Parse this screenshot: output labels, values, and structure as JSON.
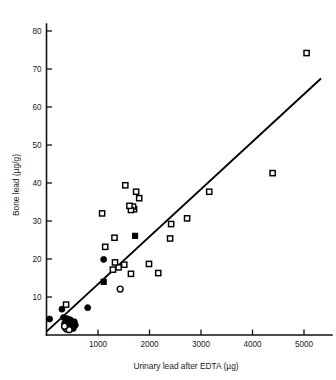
{
  "chart_data": {
    "type": "scatter",
    "title": "",
    "xlabel": "Urinary lead after EDTA (µg)",
    "ylabel": "Bone lead (µg/g)",
    "xlim": [
      0,
      5400
    ],
    "ylim": [
      0,
      84
    ],
    "xticks": [
      1000,
      2000,
      3000,
      4000,
      5000
    ],
    "xtick_labels": [
      "1000",
      "2000",
      "3000",
      "4000",
      "5000"
    ],
    "yticks": [
      10,
      20,
      30,
      40,
      50,
      60,
      70,
      80
    ],
    "ytick_labels": [
      "10",
      "20",
      "30",
      "40",
      "50",
      "60",
      "70",
      "80"
    ],
    "grid": false,
    "legend": "none",
    "marker_colors": {
      "stroke": "#000000",
      "open_fill": "#ffffff",
      "filled_fill": "#000000"
    },
    "series": [
      {
        "name": "open-square",
        "marker": "open-square",
        "points": [
          [
            5050,
            74.2
          ],
          [
            4390,
            42.6
          ],
          [
            3160,
            37.7
          ],
          [
            2730,
            30.7
          ],
          [
            2420,
            29.2
          ],
          [
            2400,
            25.4
          ],
          [
            2170,
            16.3
          ],
          [
            1990,
            18.7
          ],
          [
            1800,
            36.0
          ],
          [
            1740,
            37.7
          ],
          [
            1700,
            33.1
          ],
          [
            1680,
            33.8
          ],
          [
            1640,
            32.9
          ],
          [
            1610,
            34.0
          ],
          [
            1530,
            39.4
          ],
          [
            1400,
            17.8
          ],
          [
            1330,
            19.1
          ],
          [
            1320,
            25.6
          ],
          [
            1290,
            17.2
          ],
          [
            1140,
            23.2
          ],
          [
            1080,
            32.0
          ],
          [
            1510,
            18.5
          ],
          [
            1640,
            16.1
          ],
          [
            380,
            8.0
          ]
        ]
      },
      {
        "name": "filled-square",
        "marker": "filled-square",
        "points": [
          [
            1720,
            26.1
          ],
          [
            1110,
            14.0
          ]
        ]
      },
      {
        "name": "filled-circle",
        "marker": "filled-circle",
        "points": [
          [
            1110,
            19.9
          ],
          [
            800,
            7.2
          ],
          [
            300,
            6.8
          ],
          [
            60,
            4.2
          ],
          [
            330,
            4.6
          ],
          [
            400,
            4.3
          ],
          [
            430,
            3.7
          ],
          [
            460,
            4.0
          ],
          [
            470,
            3.1
          ],
          [
            500,
            3.4
          ],
          [
            520,
            2.9
          ],
          [
            540,
            3.5
          ],
          [
            380,
            2.6
          ],
          [
            420,
            2.2
          ],
          [
            450,
            2.4
          ],
          [
            490,
            2.0
          ],
          [
            350,
            3.0
          ],
          [
            560,
            2.6
          ],
          [
            360,
            1.9
          ],
          [
            520,
            1.7
          ]
        ]
      },
      {
        "name": "open-circle",
        "marker": "open-circle",
        "points": [
          [
            1430,
            12.1
          ],
          [
            390,
            1.6
          ],
          [
            440,
            1.4
          ],
          [
            350,
            2.3
          ]
        ]
      }
    ],
    "fit_line": {
      "name": "regression-line",
      "x0": 0,
      "y0": 0.9,
      "x1": 5330,
      "y1": 67.5
    }
  }
}
